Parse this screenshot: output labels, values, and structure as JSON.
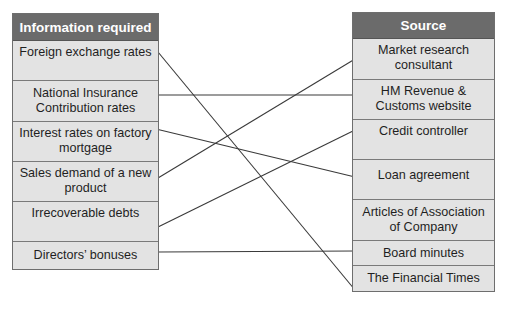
{
  "diagram": {
    "left_table": {
      "header": "Information required",
      "rows": [
        {
          "label": "Foreign exchange rates"
        },
        {
          "label": "National Insurance Contribution rates"
        },
        {
          "label": "Interest rates on factory mortgage"
        },
        {
          "label": "Sales demand of a new product"
        },
        {
          "label": "Irrecoverable debts"
        },
        {
          "label": "Directors’ bonuses"
        }
      ]
    },
    "right_table": {
      "header": "Source",
      "rows": [
        {
          "label": "Market research consultant"
        },
        {
          "label": "HM Revenue & Customs website"
        },
        {
          "label": "Credit controller"
        },
        {
          "label": "Loan agreement"
        },
        {
          "label": "Articles of Association of Company"
        },
        {
          "label": "Board minutes"
        },
        {
          "label": "The Financial Times"
        }
      ]
    },
    "connections": [
      {
        "from": "Foreign exchange rates",
        "to": "The Financial Times"
      },
      {
        "from": "National Insurance Contribution rates",
        "to": "HM Revenue & Customs website"
      },
      {
        "from": "Interest rates on factory mortgage",
        "to": "Loan agreement"
      },
      {
        "from": "Sales demand of a new product",
        "to": "Market research consultant"
      },
      {
        "from": "Irrecoverable debts",
        "to": "Credit controller"
      },
      {
        "from": "Directors’ bonuses",
        "to": "Board minutes"
      }
    ],
    "colors": {
      "header_bg": "#6b6b6b",
      "header_text": "#ffffff",
      "cell_bg": "#e3e3e3",
      "line": "#3a3a3a"
    }
  }
}
